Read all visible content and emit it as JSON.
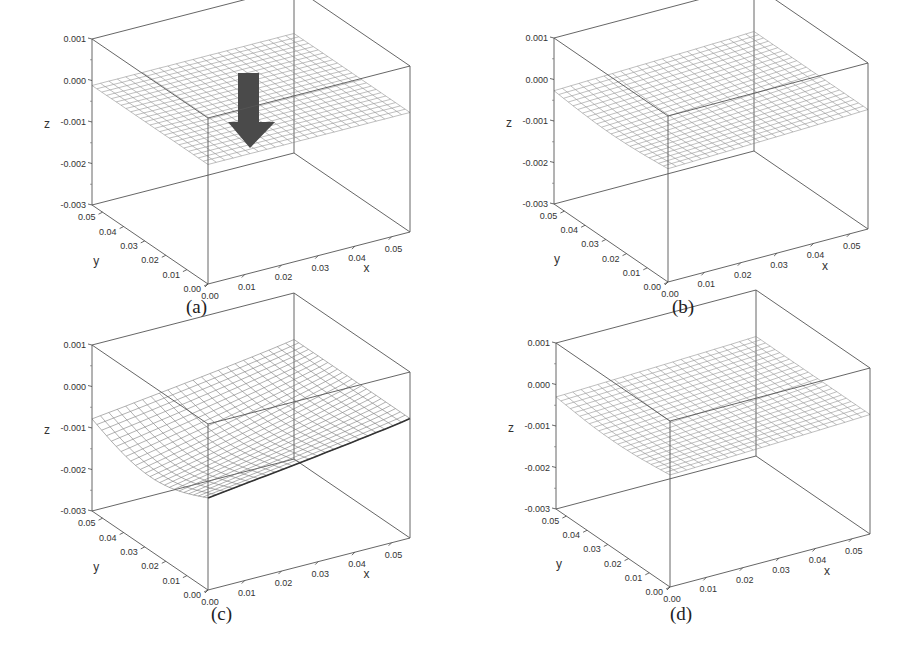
{
  "chart_data": [
    {
      "type": "surface3d",
      "panel": "(a)",
      "xlabel": "x",
      "ylabel": "y",
      "zlabel": "z",
      "x_ticks": [
        "0.00",
        "0.01",
        "0.02",
        "0.03",
        "0.04",
        "0.05"
      ],
      "y_ticks": [
        "0.00",
        "0.01",
        "0.02",
        "0.03",
        "0.04",
        "0.05"
      ],
      "z_ticks": [
        "0.001",
        "0.000",
        "-0.001",
        "-0.002",
        "-0.003"
      ],
      "xlim": [
        0,
        0.055
      ],
      "ylim": [
        0,
        0.055
      ],
      "zlim": [
        -0.003,
        0.001
      ],
      "surface": "flat plane at z ≈ 0 (initial undeformed plate)",
      "max_deflection": 0.0,
      "annotation": "downward arrow indicating applied load"
    },
    {
      "type": "surface3d",
      "panel": "(b)",
      "xlabel": "x",
      "ylabel": "y",
      "zlabel": "z",
      "x_ticks": [
        "0.00",
        "0.01",
        "0.02",
        "0.03",
        "0.04",
        "0.05"
      ],
      "y_ticks": [
        "0.00",
        "0.01",
        "0.02",
        "0.03",
        "0.04",
        "0.05"
      ],
      "z_ticks": [
        "0.001",
        "0.000",
        "-0.001",
        "-0.002",
        "-0.003"
      ],
      "xlim": [
        0,
        0.055
      ],
      "ylim": [
        0,
        0.055
      ],
      "zlim": [
        -0.003,
        0.001
      ],
      "surface": "slightly deflected plate",
      "max_deflection": -0.0002
    },
    {
      "type": "surface3d",
      "panel": "(c)",
      "xlabel": "x",
      "ylabel": "y",
      "zlabel": "z",
      "x_ticks": [
        "0.00",
        "0.01",
        "0.02",
        "0.03",
        "0.04",
        "0.05"
      ],
      "y_ticks": [
        "0.00",
        "0.01",
        "0.02",
        "0.03",
        "0.04",
        "0.05"
      ],
      "z_ticks": [
        "0.001",
        "0.000",
        "-0.001",
        "-0.002",
        "-0.003"
      ],
      "xlim": [
        0,
        0.055
      ],
      "ylim": [
        0,
        0.055
      ],
      "zlim": [
        -0.003,
        0.001
      ],
      "surface": "strongly deflected plate (bowl shape)",
      "max_deflection": -0.0011
    },
    {
      "type": "surface3d",
      "panel": "(d)",
      "xlabel": "x",
      "ylabel": "y",
      "zlabel": "z",
      "x_ticks": [
        "0.00",
        "0.01",
        "0.02",
        "0.03",
        "0.04",
        "0.05"
      ],
      "y_ticks": [
        "0.00",
        "0.01",
        "0.02",
        "0.03",
        "0.04",
        "0.05"
      ],
      "z_ticks": [
        "0.001",
        "0.000",
        "-0.001",
        "-0.002",
        "-0.003"
      ],
      "xlim": [
        0,
        0.055
      ],
      "ylim": [
        0,
        0.055
      ],
      "zlim": [
        -0.003,
        0.001
      ],
      "surface": "slightly deflected plate",
      "max_deflection": -0.0003
    }
  ],
  "panels": [
    {
      "caption": "(a)",
      "origin": [
        208,
        284
      ],
      "ex": [
        202,
        -52
      ],
      "ey": [
        -116,
        -79
      ],
      "ez": [
        0,
        -41.5
      ],
      "arrow": true,
      "depth": 0.0,
      "left": 0,
      "top": 0,
      "cap_x": 186,
      "cap_y": 299
    },
    {
      "caption": "(b)",
      "origin": [
        668,
        282
      ],
      "ex": [
        200,
        -53
      ],
      "ey": [
        -114,
        -78
      ],
      "ez": [
        0,
        -41.5
      ],
      "arrow": false,
      "depth": 0.00025,
      "left": 0,
      "top": 0,
      "cap_x": 674,
      "cap_y": 299
    },
    {
      "caption": "(c)",
      "origin": [
        208,
        590
      ],
      "ex": [
        202,
        -52
      ],
      "ey": [
        -116,
        -79
      ],
      "ez": [
        0,
        -41.5
      ],
      "arrow": false,
      "depth": 0.0011,
      "left": 0,
      "top": 0,
      "cap_x": 213,
      "cap_y": 605
    },
    {
      "caption": "(d)",
      "origin": [
        670,
        587
      ],
      "ex": [
        200,
        -53
      ],
      "ey": [
        -114,
        -78
      ],
      "ez": [
        0,
        -41.5
      ],
      "arrow": false,
      "depth": 0.0003,
      "left": 0,
      "top": 0,
      "cap_x": 671,
      "cap_y": 604
    }
  ],
  "labels": {
    "x": "x",
    "y": "y",
    "z": "z",
    "ticks": [
      "0.00",
      "0.01",
      "0.02",
      "0.03",
      "0.04",
      "0.05"
    ],
    "zticks": [
      "0.001",
      "0.000",
      "-0.001",
      "-0.002",
      "-0.003"
    ]
  }
}
